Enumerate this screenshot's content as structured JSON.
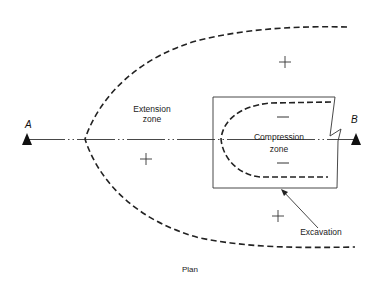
{
  "figure": {
    "caption": "Plan",
    "points": {
      "a": "A",
      "b": "B"
    },
    "zones": {
      "extension_line1": "Extension",
      "extension_line2": "zone",
      "compression_line1": "Compression",
      "compression_line2": "zone"
    },
    "callouts": {
      "excavation": "Excavation"
    },
    "signs": {
      "plus": "+",
      "minus": "−"
    },
    "colors": {
      "line": "#222222",
      "background": "#ffffff"
    }
  }
}
